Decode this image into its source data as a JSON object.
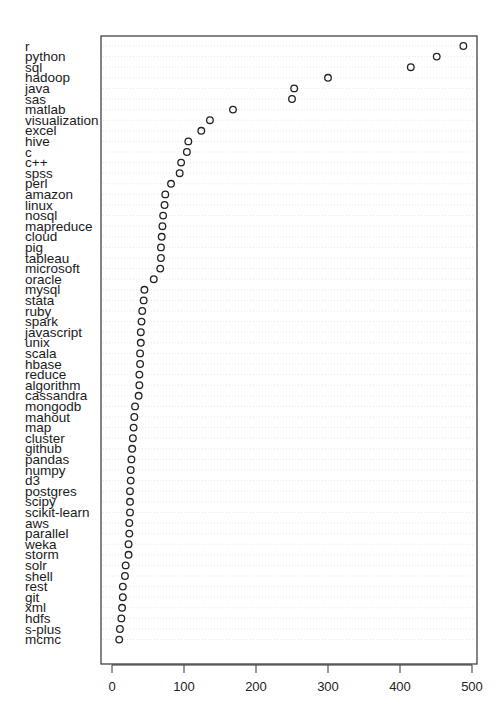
{
  "chart_data": {
    "type": "scatter",
    "subtype": "dotchart",
    "title": "",
    "xlabel": "",
    "ylabel": "",
    "xlim": [
      0,
      500
    ],
    "x_ticks": [
      0,
      100,
      200,
      300,
      400,
      500
    ],
    "x_tick_labels": [
      "0",
      "100",
      "200",
      "300",
      "400",
      "500"
    ],
    "grid": "dotted horizontal guides per row",
    "legend": "none",
    "categories": [
      "r",
      "python",
      "sql",
      "hadoop",
      "java",
      "sas",
      "matlab",
      "visualization",
      "excel",
      "hive",
      "c",
      "c++",
      "spss",
      "perl",
      "amazon",
      "linux",
      "nosql",
      "mapreduce",
      "cloud",
      "pig",
      "tableau",
      "microsoft",
      "oracle",
      "mysql",
      "stata",
      "ruby",
      "spark",
      "javascript",
      "unix",
      "scala",
      "hbase",
      "reduce",
      "algorithm",
      "cassandra",
      "mongodb",
      "mahout",
      "map",
      "cluster",
      "github",
      "pandas",
      "numpy",
      "d3",
      "postgres",
      "scipy",
      "scikit-learn",
      "aws",
      "parallel",
      "weka",
      "storm",
      "solr",
      "shell",
      "rest",
      "git",
      "xml",
      "hdfs",
      "s-plus",
      "mcmc"
    ],
    "values": [
      488,
      451,
      415,
      300,
      253,
      250,
      168,
      136,
      124,
      106,
      104,
      96,
      94,
      82,
      74,
      73,
      71,
      70,
      69,
      68,
      68,
      67,
      58,
      45,
      44,
      42,
      41,
      40,
      40,
      39,
      39,
      38,
      38,
      37,
      32,
      31,
      30,
      29,
      28,
      27,
      26,
      26,
      25,
      25,
      25,
      24,
      24,
      23,
      23,
      19,
      18,
      15,
      15,
      14,
      13,
      11,
      10
    ]
  }
}
